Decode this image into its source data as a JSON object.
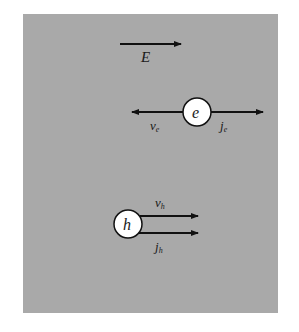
{
  "diagram": {
    "background_color": "#a9a9a9",
    "field": {
      "label": "E",
      "direction": "right"
    },
    "electron": {
      "label": "e",
      "velocity_label": "v",
      "velocity_subscript": "e",
      "velocity_direction": "left",
      "current_label": "j",
      "current_subscript": "e",
      "current_direction": "right"
    },
    "hole": {
      "label": "h",
      "velocity_label": "v",
      "velocity_subscript": "h",
      "velocity_direction": "right",
      "current_label": "j",
      "current_subscript": "h",
      "current_direction": "right"
    }
  }
}
